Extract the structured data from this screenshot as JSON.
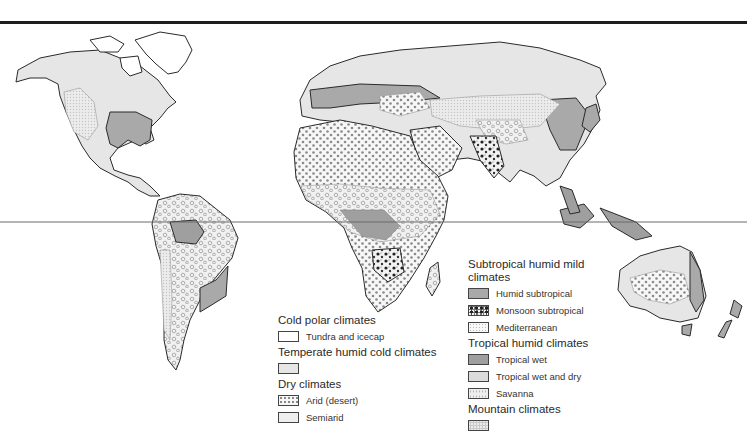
{
  "map": {
    "type": "world climate regions map",
    "equator_line": true,
    "colors": {
      "coastline": "#2a2a2a",
      "tundra_and_icecap": "#ffffff",
      "temperate_humid_cold": "#e6e6e6",
      "semiarid": "#efefef",
      "humid_subtropical": "#a9a9a9",
      "tropical_wet": "#9f9f9f",
      "tropical_wet_and_dry": "#dcdcdc",
      "top_rule": "#1e1e1e"
    }
  },
  "legend": {
    "left_column": [
      {
        "title": "Cold polar climates",
        "items": [
          {
            "label": "Tundra and icecap",
            "pattern": "plain-white"
          }
        ]
      },
      {
        "title": "Temperate humid cold climates",
        "items": [
          {
            "label": "",
            "pattern": "light-gray"
          }
        ]
      },
      {
        "title": "Dry climates",
        "items": [
          {
            "label": "Arid (desert)",
            "pattern": "dots"
          },
          {
            "label": "Semiarid",
            "pattern": "very-light-gray"
          }
        ]
      }
    ],
    "right_column": [
      {
        "title": "Subtropical humid mild climates",
        "items": [
          {
            "label": "Humid subtropical",
            "pattern": "medium-gray"
          },
          {
            "label": "Monsoon subtropical",
            "pattern": "black-blotches"
          },
          {
            "label": "Mediterranean",
            "pattern": "fine-stipple"
          }
        ]
      },
      {
        "title": "Tropical humid climates",
        "items": [
          {
            "label": "Tropical wet",
            "pattern": "dark-gray"
          },
          {
            "label": "Tropical wet and dry",
            "pattern": "light-gray"
          },
          {
            "label": "Savanna",
            "pattern": "circles"
          }
        ]
      },
      {
        "title": "Mountain climates",
        "items": [
          {
            "label": "",
            "pattern": "stipple-gray"
          }
        ]
      }
    ]
  }
}
